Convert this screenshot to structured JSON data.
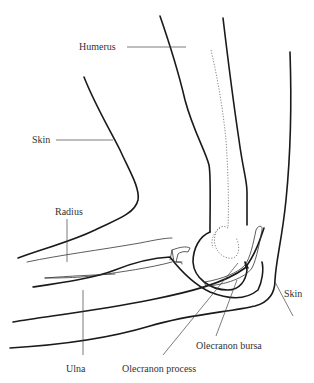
{
  "diagram": {
    "labels": {
      "humerus": "Humerus",
      "skin_left": "Skin",
      "radius": "Radius",
      "ulna": "Ulna",
      "olecranon_process": "Olecranon process",
      "olecranon_bursa": "Olecranon bursa",
      "skin_right": "Skin"
    },
    "colors": {
      "line": "#1a1a1a",
      "label": "#333333",
      "background": "#ffffff"
    }
  }
}
